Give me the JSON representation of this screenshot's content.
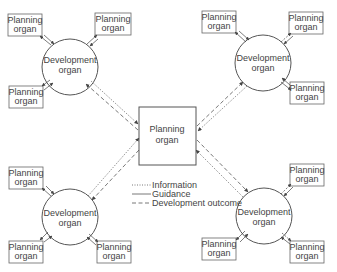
{
  "center": {
    "line1": "Planning",
    "line2": "organ"
  },
  "dev": {
    "line1": "Development",
    "line2": "organ"
  },
  "planning": {
    "line1": "Planning",
    "line2": "organ"
  },
  "legend": {
    "information": "Information",
    "guidance": "Guidance",
    "development_outcome": "Development outcome"
  },
  "colors": {
    "line": "#555555",
    "text": "#444444"
  }
}
